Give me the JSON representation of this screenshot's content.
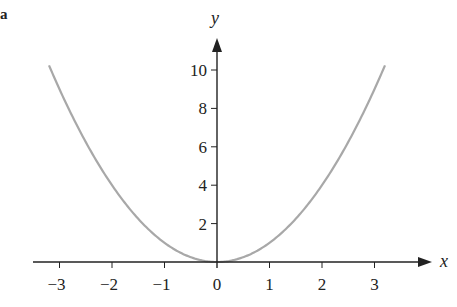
{
  "panel_label": "a",
  "chart_data": {
    "type": "line",
    "title": "",
    "xlabel": "x",
    "ylabel": "y",
    "function": "y = x^2",
    "xlim": [
      -3.2,
      3.2
    ],
    "ylim": [
      0,
      10.3
    ],
    "x_ticks": [
      -3,
      -2,
      -1,
      0,
      1,
      2,
      3
    ],
    "x_tick_labels": [
      "−3",
      "−2",
      "−1",
      "0",
      "1",
      "2",
      "3"
    ],
    "y_ticks": [
      2,
      4,
      6,
      8,
      10
    ],
    "y_tick_labels": [
      "2",
      "4",
      "6",
      "8",
      "10"
    ],
    "grid": false,
    "legend": null,
    "series": [
      {
        "name": "y = x^2",
        "color": "#a8a8a8",
        "x": [
          -3.2,
          -3,
          -2.5,
          -2,
          -1.5,
          -1,
          -0.5,
          0,
          0.5,
          1,
          1.5,
          2,
          2.5,
          3,
          3.2
        ],
        "y": [
          10.24,
          9,
          6.25,
          4,
          2.25,
          1,
          0.25,
          0,
          0.25,
          1,
          2.25,
          4,
          6.25,
          9,
          10.24
        ]
      }
    ]
  },
  "colors": {
    "axis": "#222222",
    "curve": "#a8a8a8"
  }
}
